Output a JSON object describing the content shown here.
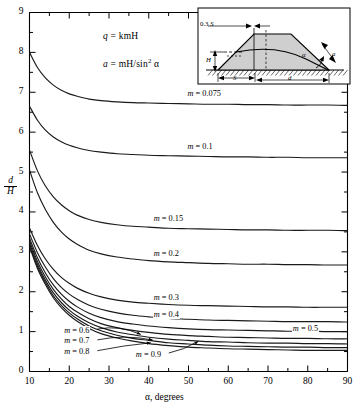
{
  "chart_data": {
    "type": "line",
    "title": "",
    "xlabel": "α, degrees",
    "ylabel": "d/H",
    "ylabel_numerator": "d",
    "ylabel_denominator": "H",
    "xlim": [
      10,
      90
    ],
    "ylim": [
      0,
      9
    ],
    "xticks": [
      10,
      20,
      30,
      40,
      50,
      60,
      70,
      80,
      90
    ],
    "yticks": [
      0,
      1,
      2,
      3,
      4,
      5,
      6,
      7,
      8,
      9
    ],
    "xminor_step": 5,
    "yminor_step": 0.5,
    "grid": false,
    "legend_position": "inline-labels",
    "annotations": [
      {
        "text": "q = kmH",
        "x": 30,
        "y": 8.35
      },
      {
        "text": "a = mH/sin² α",
        "x": 30,
        "y": 7.75
      }
    ],
    "series": [
      {
        "name": "m = 0.075",
        "m": 0.075,
        "label": "m = 0.075",
        "x": [
          10,
          12,
          14,
          16,
          18,
          20,
          22,
          25,
          28,
          32,
          36,
          40,
          45,
          50,
          55,
          60,
          65,
          70,
          75,
          80,
          85,
          90
        ],
        "y": [
          8.0,
          7.62,
          7.36,
          7.18,
          7.05,
          6.96,
          6.9,
          6.83,
          6.79,
          6.76,
          6.74,
          6.73,
          6.72,
          6.71,
          6.7,
          6.7,
          6.69,
          6.69,
          6.68,
          6.68,
          6.68,
          6.67
        ]
      },
      {
        "name": "m = 0.1",
        "m": 0.1,
        "label": "m = 0.1",
        "x": [
          10,
          12,
          14,
          16,
          18,
          20,
          22,
          25,
          28,
          32,
          36,
          40,
          45,
          50,
          55,
          60,
          65,
          70,
          75,
          80,
          85,
          90
        ],
        "y": [
          6.65,
          6.3,
          6.05,
          5.88,
          5.76,
          5.67,
          5.61,
          5.54,
          5.5,
          5.46,
          5.44,
          5.42,
          5.41,
          5.4,
          5.39,
          5.38,
          5.38,
          5.37,
          5.37,
          5.36,
          5.36,
          5.36
        ]
      },
      {
        "name": "m = 0.15",
        "m": 0.15,
        "label": "m = 0.15",
        "x": [
          10,
          12,
          14,
          16,
          18,
          20,
          22,
          25,
          28,
          32,
          36,
          40,
          45,
          50,
          55,
          60,
          65,
          70,
          75,
          80,
          85,
          90
        ],
        "y": [
          5.55,
          5.03,
          4.65,
          4.38,
          4.18,
          4.03,
          3.92,
          3.81,
          3.74,
          3.68,
          3.64,
          3.62,
          3.59,
          3.58,
          3.57,
          3.56,
          3.55,
          3.55,
          3.54,
          3.54,
          3.54,
          3.53
        ]
      },
      {
        "name": "m = 0.2",
        "m": 0.2,
        "label": "m = 0.2",
        "x": [
          10,
          12,
          14,
          16,
          18,
          20,
          22,
          25,
          28,
          32,
          36,
          40,
          45,
          50,
          55,
          60,
          65,
          70,
          75,
          80,
          85,
          90
        ],
        "y": [
          5.05,
          4.48,
          4.06,
          3.74,
          3.5,
          3.32,
          3.19,
          3.04,
          2.95,
          2.87,
          2.82,
          2.78,
          2.75,
          2.73,
          2.71,
          2.7,
          2.69,
          2.69,
          2.68,
          2.68,
          2.67,
          2.67
        ]
      },
      {
        "name": "m = 0.3",
        "m": 0.3,
        "label": "m = 0.3",
        "x": [
          10,
          12,
          14,
          16,
          18,
          20,
          22,
          25,
          28,
          32,
          36,
          40,
          45,
          50,
          55,
          60,
          65,
          70,
          75,
          80,
          85,
          90
        ],
        "y": [
          3.6,
          3.16,
          2.82,
          2.56,
          2.36,
          2.21,
          2.09,
          1.96,
          1.87,
          1.79,
          1.74,
          1.71,
          1.68,
          1.66,
          1.65,
          1.64,
          1.63,
          1.62,
          1.62,
          1.61,
          1.61,
          1.61
        ]
      },
      {
        "name": "m = 0.4",
        "m": 0.4,
        "label": "m = 0.4",
        "x": [
          10,
          12,
          14,
          16,
          18,
          20,
          22,
          25,
          28,
          32,
          36,
          40,
          45,
          50,
          55,
          60,
          65,
          70,
          75,
          80,
          85,
          90
        ],
        "y": [
          3.45,
          2.98,
          2.62,
          2.33,
          2.11,
          1.94,
          1.81,
          1.66,
          1.56,
          1.47,
          1.41,
          1.37,
          1.33,
          1.31,
          1.29,
          1.28,
          1.27,
          1.26,
          1.25,
          1.25,
          1.25,
          1.24
        ]
      },
      {
        "name": "m = 0.5",
        "m": 0.5,
        "label": "m = 0.5",
        "x": [
          10,
          12,
          14,
          16,
          18,
          20,
          22,
          25,
          28,
          32,
          36,
          40,
          45,
          50,
          55,
          60,
          65,
          70,
          75,
          80,
          85,
          90
        ],
        "y": [
          3.35,
          2.85,
          2.47,
          2.17,
          1.94,
          1.76,
          1.62,
          1.46,
          1.35,
          1.25,
          1.19,
          1.14,
          1.1,
          1.07,
          1.05,
          1.04,
          1.03,
          1.02,
          1.01,
          1.01,
          1.0,
          1.0
        ]
      },
      {
        "name": "m = 0.6",
        "m": 0.6,
        "label": "m = 0.6",
        "x": [
          10,
          12,
          14,
          16,
          18,
          20,
          22,
          25,
          28,
          32,
          36,
          40,
          45,
          50,
          55,
          60,
          65,
          70,
          75,
          80,
          85,
          90
        ],
        "y": [
          3.28,
          2.76,
          2.37,
          2.06,
          1.82,
          1.63,
          1.49,
          1.32,
          1.2,
          1.1,
          1.03,
          0.98,
          0.93,
          0.9,
          0.88,
          0.86,
          0.85,
          0.84,
          0.83,
          0.83,
          0.82,
          0.82
        ]
      },
      {
        "name": "m = 0.7",
        "m": 0.7,
        "label": "m = 0.7",
        "x": [
          10,
          12,
          14,
          16,
          18,
          20,
          22,
          25,
          28,
          32,
          36,
          40,
          45,
          50,
          55,
          60,
          65,
          70,
          75,
          80,
          85,
          90
        ],
        "y": [
          3.22,
          2.69,
          2.29,
          1.97,
          1.73,
          1.54,
          1.39,
          1.22,
          1.1,
          0.99,
          0.92,
          0.86,
          0.81,
          0.78,
          0.75,
          0.74,
          0.72,
          0.71,
          0.71,
          0.7,
          0.7,
          0.69
        ]
      },
      {
        "name": "m = 0.8",
        "m": 0.8,
        "label": "m = 0.8",
        "x": [
          10,
          12,
          14,
          16,
          18,
          20,
          22,
          25,
          28,
          32,
          36,
          40,
          45,
          50,
          55,
          60,
          65,
          70,
          75,
          80,
          85,
          90
        ],
        "y": [
          3.17,
          2.63,
          2.23,
          1.9,
          1.66,
          1.47,
          1.32,
          1.14,
          1.02,
          0.91,
          0.83,
          0.78,
          0.72,
          0.69,
          0.66,
          0.64,
          0.63,
          0.62,
          0.61,
          0.61,
          0.6,
          0.6
        ]
      },
      {
        "name": "m = 0.9",
        "m": 0.9,
        "label": "m = 0.9",
        "x": [
          10,
          12,
          14,
          16,
          18,
          20,
          22,
          25,
          28,
          32,
          36,
          40,
          45,
          50,
          55,
          60,
          65,
          70,
          75,
          80,
          85,
          90
        ],
        "y": [
          3.13,
          2.58,
          2.18,
          1.85,
          1.6,
          1.41,
          1.26,
          1.08,
          0.95,
          0.84,
          0.76,
          0.7,
          0.65,
          0.61,
          0.59,
          0.57,
          0.56,
          0.55,
          0.54,
          0.53,
          0.53,
          0.53
        ]
      }
    ],
    "curve_labels": [
      {
        "text": "m = 0.075",
        "x": 49.5,
        "y": 6.93,
        "leader": false
      },
      {
        "text": "m = 0.1",
        "x": 49.5,
        "y": 5.6,
        "leader": false
      },
      {
        "text": "m = 0.15",
        "x": 41.0,
        "y": 3.8,
        "leader": false
      },
      {
        "text": "m = 0.2",
        "x": 41.0,
        "y": 2.92,
        "leader": false
      },
      {
        "text": "m = 0.3",
        "x": 41.0,
        "y": 1.82,
        "leader": false
      },
      {
        "text": "m = 0.4",
        "x": 41.0,
        "y": 1.4,
        "leader": false
      },
      {
        "text": "m = 0.5",
        "x": 76.0,
        "y": 1.03,
        "leader": false
      },
      {
        "text": "m = 0.6",
        "x": 18.5,
        "y": 1.0,
        "leader": true,
        "tip_x": 38.0,
        "tip_y": 0.93
      },
      {
        "text": "m = 0.7",
        "x": 18.5,
        "y": 0.73,
        "leader": true,
        "tip_x": 41.0,
        "tip_y": 0.79
      },
      {
        "text": "m = 0.8",
        "x": 18.5,
        "y": 0.46,
        "leader": true,
        "tip_x": 40.5,
        "tip_y": 0.72
      },
      {
        "text": "m = 0.9",
        "x": 36.5,
        "y": 0.4,
        "leader": true,
        "tip_x": 52.5,
        "tip_y": 0.76
      }
    ]
  },
  "inset": {
    "name": "embankment-cross-section",
    "labels": {
      "crest_offset": "0.3 S",
      "height": "H",
      "base_offset": "S",
      "base_width": "d",
      "slope_angle": "α",
      "thickness": "a"
    }
  },
  "axis": {
    "x_title": "α, degrees",
    "x_ticklabels": [
      "10",
      "20",
      "30",
      "40",
      "50",
      "60",
      "70",
      "80",
      "90"
    ],
    "y_ticklabels": [
      "0",
      "1",
      "2",
      "3",
      "4",
      "5",
      "6",
      "7",
      "8",
      "9"
    ],
    "y_title_num": "d",
    "y_title_den": "H"
  },
  "equations": {
    "discharge": "q = kmH",
    "thickness": "a = mH/sin² α",
    "discharge_var": "q",
    "discharge_rhs": "= kmH",
    "thickness_var": "a",
    "thickness_rhs_pre": "= mH/sin",
    "thickness_rhs_sup": "2",
    "thickness_rhs_post": "α"
  }
}
